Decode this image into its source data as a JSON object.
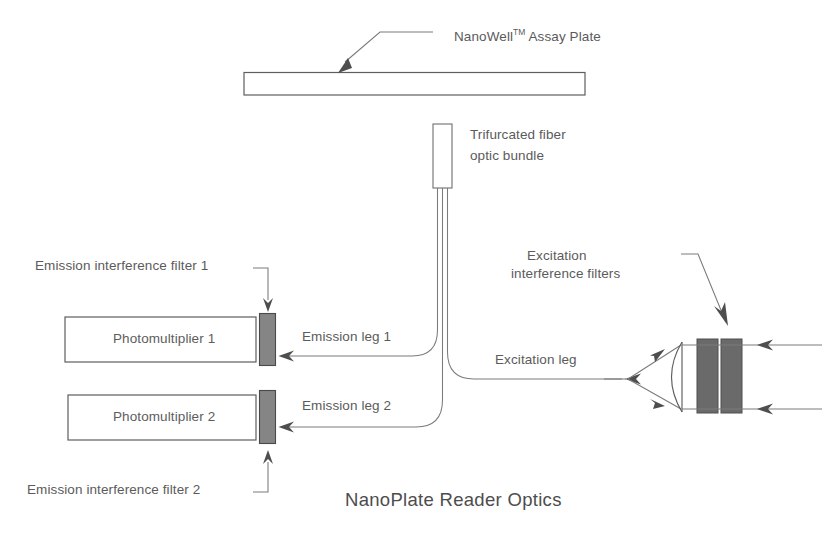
{
  "figure": {
    "caption": "NanoPlate Reader Optics",
    "line_color": "#6b6b6b",
    "fill_color": "#6a6a6a",
    "text_color": "#5b5b5b"
  },
  "labels": {
    "assay_plate": "NanoWell",
    "assay_plate_tm": "TM",
    "assay_plate_rest": " Assay Plate",
    "fiber_bundle_line1": "Trifurcated fiber",
    "fiber_bundle_line2": "optic bundle",
    "excitation_filters_line1": "Excitation",
    "excitation_filters_line2": "interference filters",
    "emission_filter_1": "Emission interference filter 1",
    "emission_filter_2": "Emission interference filter 2",
    "emission_leg_1": "Emission leg 1",
    "emission_leg_2": "Emission leg 2",
    "excitation_leg": "Excitation leg",
    "photomultiplier_1": "Photomultiplier 1",
    "photomultiplier_2": "Photomultiplier 2"
  },
  "components": {
    "plate": {
      "name": "NanoWell Assay Plate",
      "shape": "thin-rectangle"
    },
    "ferrule": {
      "name": "Trifurcated fiber optic bundle common end",
      "shape": "vertical-rectangle"
    },
    "pmt1": {
      "name": "Photomultiplier 1",
      "shape": "rectangle"
    },
    "pmt2": {
      "name": "Photomultiplier 2",
      "shape": "rectangle"
    },
    "emission_filter_1": {
      "name": "Emission interference filter 1",
      "shape": "filled-rectangle"
    },
    "emission_filter_2": {
      "name": "Emission interference filter 2",
      "shape": "filled-rectangle"
    },
    "excitation_filter_a": {
      "name": "Excitation interference filter A",
      "shape": "filled-rectangle"
    },
    "excitation_filter_b": {
      "name": "Excitation interference filter B",
      "shape": "filled-rectangle"
    },
    "lens": {
      "name": "Collimating lens",
      "shape": "arc"
    }
  }
}
